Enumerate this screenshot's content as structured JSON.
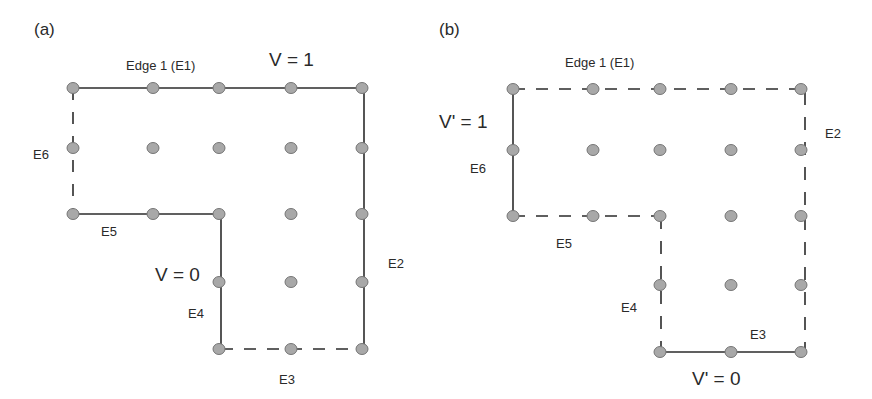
{
  "figure": {
    "panels": [
      {
        "id": "a",
        "panel_label": "(a)",
        "title": "Edge 1 (E1)",
        "potential_high": "V = 1",
        "potential_low": "V = 0",
        "edges": {
          "E2": "E2",
          "E3": "E3",
          "E4": "E4",
          "E5": "E5",
          "E6": "E6"
        },
        "grid_columns_x": [
          73,
          153,
          219,
          291,
          362
        ],
        "grid_rows_y": [
          88,
          148,
          214,
          282,
          349
        ],
        "edge_styles": {
          "E1": "solid",
          "E2": "solid",
          "E3": "dashed",
          "E4": "solid",
          "E5": "solid",
          "E6": "dashed"
        }
      },
      {
        "id": "b",
        "panel_label": "(b)",
        "title": "Edge 1 (E1)",
        "potential_high": "V' = 1",
        "potential_low": "V' = 0",
        "edges": {
          "E2": "E2",
          "E3": "E3",
          "E4": "E4",
          "E5": "E5",
          "E6": "E6"
        },
        "grid_columns_x": [
          513,
          593,
          660,
          731,
          801
        ],
        "grid_rows_y": [
          89,
          150,
          216,
          285,
          352
        ],
        "edge_styles": {
          "E1": "dashed",
          "E2": "dashed",
          "E3": "solid",
          "E4": "dashed",
          "E5": "dashed",
          "E6": "solid"
        }
      }
    ],
    "colors": {
      "node_fill": "#a8a8a8",
      "node_stroke": "#777777",
      "line": "#2b2b2b"
    }
  }
}
